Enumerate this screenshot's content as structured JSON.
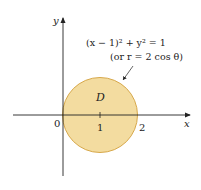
{
  "diagram": {
    "type": "region-plot",
    "axes": {
      "x_label": "x",
      "y_label": "y",
      "origin_label": "0",
      "tick_labels": [
        "1",
        "2"
      ]
    },
    "region": {
      "label": "D",
      "shape": "circle",
      "center": [
        1,
        0
      ],
      "radius": 1,
      "fill_color": "#f3dca0",
      "stroke_color": "#d7a84a"
    },
    "annotation": {
      "equation": "(x − 1)² + y² = 1",
      "polar": "(or r = 2 cos θ)"
    }
  }
}
